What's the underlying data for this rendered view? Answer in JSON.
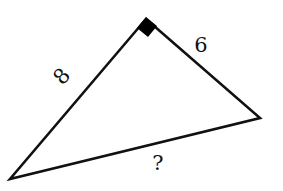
{
  "diagram": {
    "type": "right-triangle",
    "colors": {
      "stroke": "#111111",
      "background": "#ffffff",
      "right_angle_marker": "#000000"
    },
    "vertices": {
      "right_angle": {
        "x": 146,
        "y": 19
      },
      "bottom_left": {
        "x": 10,
        "y": 179
      },
      "right": {
        "x": 260,
        "y": 118
      }
    },
    "sides": {
      "left_leg": {
        "label": "8",
        "from": "bottom_left",
        "to": "right_angle"
      },
      "right_leg": {
        "label": "6",
        "from": "right_angle",
        "to": "right"
      },
      "hypotenuse": {
        "label": "?",
        "from": "bottom_left",
        "to": "right"
      }
    },
    "right_angle_marker": "filled-square"
  }
}
